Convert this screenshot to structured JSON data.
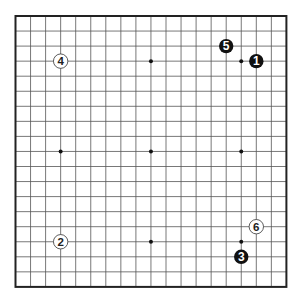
{
  "board": {
    "size": 19,
    "origin_x": 15.5,
    "origin_y": 16,
    "spacing": 15.05,
    "background": "#ffffff",
    "line_color": "#555555",
    "border_color": "#222222",
    "hoshi": [
      [
        3,
        3
      ],
      [
        9,
        3
      ],
      [
        15,
        3
      ],
      [
        3,
        9
      ],
      [
        9,
        9
      ],
      [
        15,
        9
      ],
      [
        3,
        15
      ],
      [
        9,
        15
      ],
      [
        15,
        15
      ]
    ]
  },
  "stones": [
    {
      "move": "1",
      "color": "black",
      "col": 16,
      "row": 3
    },
    {
      "move": "2",
      "color": "white",
      "col": 3,
      "row": 15
    },
    {
      "move": "3",
      "color": "black",
      "col": 15,
      "row": 16
    },
    {
      "move": "4",
      "color": "white",
      "col": 3,
      "row": 3
    },
    {
      "move": "5",
      "color": "black",
      "col": 14,
      "row": 2
    },
    {
      "move": "6",
      "color": "white",
      "col": 16,
      "row": 14
    }
  ],
  "colors": {
    "black_stone": "#111111",
    "white_stone": "#ffffff",
    "white_stone_outline": "#333333",
    "black_label": "#ffffff",
    "white_label": "#222222"
  }
}
